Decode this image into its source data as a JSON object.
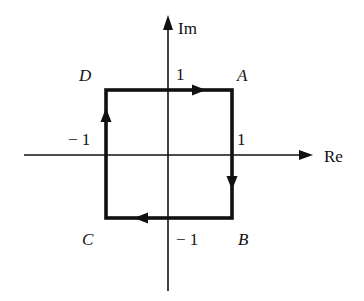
{
  "diagram": {
    "axes": {
      "x_label": "Re",
      "y_label": "Im"
    },
    "vertices": [
      {
        "name": "A",
        "coord": "1 + i"
      },
      {
        "name": "B",
        "coord": "1 - i"
      },
      {
        "name": "C",
        "coord": "-1 - i"
      },
      {
        "name": "D",
        "coord": "-1 + i"
      }
    ],
    "tick_labels": {
      "top": "1",
      "bottom": "− 1",
      "left": "− 1",
      "right": "1"
    },
    "path_direction": "clockwise: A → B → C → D → A",
    "colors": {
      "stroke": "#111111",
      "background": "#ffffff"
    }
  }
}
